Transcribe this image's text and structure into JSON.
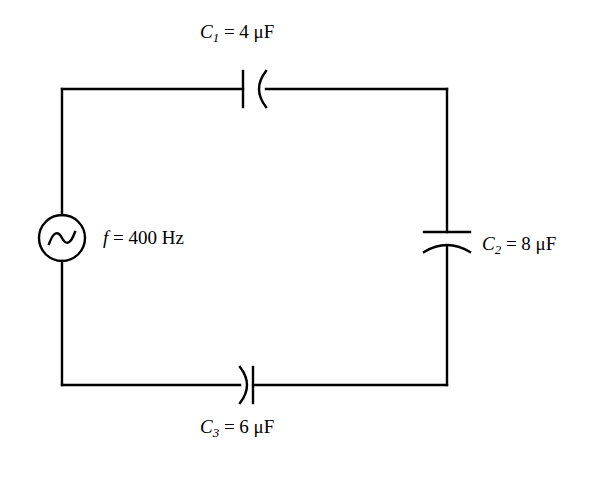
{
  "diagram": {
    "type": "ac-capacitor-circuit-schematic",
    "background_color": "#ffffff",
    "stroke_color": "#000000",
    "components": {
      "source": {
        "name": "ac-voltage-source",
        "symbol": "circle-with-sine-wave",
        "frequency_label_symbol": "f",
        "frequency_equals": "=",
        "frequency_value": "400",
        "frequency_unit": "Hz"
      },
      "c1": {
        "name": "capacitor-c1",
        "symbol": "curved-capacitor",
        "position": "top-wire",
        "orientation": "vertical-plates-arc-opens-right",
        "label_symbol": "C",
        "label_subscript": "1",
        "label_equals": "=",
        "label_value": "4",
        "label_unit": "μF"
      },
      "c2": {
        "name": "capacitor-c2",
        "symbol": "curved-capacitor",
        "position": "right-wire",
        "orientation": "horizontal-plates-arc-opens-down",
        "label_symbol": "C",
        "label_subscript": "2",
        "label_equals": "=",
        "label_value": "8",
        "label_unit": "μF"
      },
      "c3": {
        "name": "capacitor-c3",
        "symbol": "curved-capacitor",
        "position": "bottom-wire",
        "orientation": "vertical-plates-arc-opens-left",
        "label_symbol": "C",
        "label_subscript": "3",
        "label_equals": "=",
        "label_value": "6",
        "label_unit": "μF"
      }
    }
  }
}
